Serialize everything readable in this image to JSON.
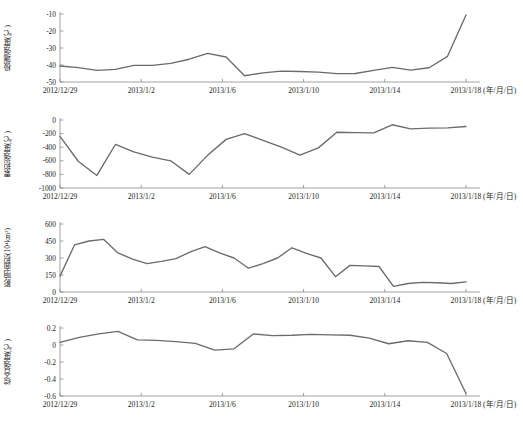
{
  "figure": {
    "partial_top_caption": "",
    "x_unit_label": "(年/月/日)",
    "x_tick_labels": [
      "2012/12/29",
      "2013/1/2",
      "2013/1/6",
      "2013/1/10",
      "2013/1/14",
      "2013/1/18"
    ],
    "line_color": "#6b6b6b",
    "axis_color": "#8c8c8c",
    "text_color": "#262626"
  },
  "chart_data": [
    {
      "type": "line",
      "title": "",
      "panel_index": 1,
      "ylabel": "极端强度(℃)",
      "xlabel": "(年/月/日)",
      "ylim": [
        -50,
        -10
      ],
      "ytick_labels": [
        "-10",
        "-20",
        "-30",
        "-40",
        "-50"
      ],
      "ytick_values": [
        -10,
        -20,
        -30,
        -40,
        -50
      ],
      "grid": false,
      "legend": "none",
      "x": [
        "2012/12/29",
        "2012/12/30",
        "2012/12/31",
        "2013/1/1",
        "2013/1/2",
        "2013/1/3",
        "2013/1/4",
        "2013/1/5",
        "2013/1/6",
        "2013/1/7",
        "2013/1/8",
        "2013/1/9",
        "2013/1/10",
        "2013/1/11",
        "2013/1/12",
        "2013/1/13",
        "2013/1/14",
        "2013/1/15",
        "2013/1/16",
        "2013/1/17",
        "2013/1/18",
        "2013/1/19"
      ],
      "values": [
        -40.6,
        -41.5,
        -43.2,
        -42.6,
        -40.2,
        -40.2,
        -39.0,
        -36.6,
        -33.2,
        -35.3,
        -46.3,
        -44.6,
        -43.6,
        -43.8,
        -44.2,
        -45.1,
        -45.0,
        -43.2,
        -41.4,
        -43.0,
        -41.6,
        -34.9,
        -10.6
      ],
      "values_note": "extreme intensity per day, deg C"
    },
    {
      "type": "line",
      "title": "",
      "panel_index": 2,
      "ylabel": "累积强度(℃)",
      "xlabel": "(年/月/日)",
      "ylim": [
        -1000,
        0
      ],
      "ytick_labels": [
        "0",
        "-200",
        "-400",
        "-600",
        "-800",
        "-1000"
      ],
      "ytick_values": [
        0,
        -200,
        -400,
        -600,
        -800,
        -1000
      ],
      "grid": false,
      "legend": "none",
      "x": [
        "2012/12/29",
        "2012/12/30",
        "2012/12/31",
        "2013/1/1",
        "2013/1/2",
        "2013/1/3",
        "2013/1/4",
        "2013/1/5",
        "2013/1/6",
        "2013/1/7",
        "2013/1/8",
        "2013/1/9",
        "2013/1/10",
        "2013/1/11",
        "2013/1/12",
        "2013/1/13",
        "2013/1/14",
        "2013/1/15",
        "2013/1/16",
        "2013/1/17",
        "2013/1/18"
      ],
      "values": [
        -240,
        -610,
        -815,
        -360,
        -470,
        -545,
        -600,
        -800,
        -520,
        -285,
        -200,
        -300,
        -400,
        -515,
        -410,
        -180,
        -185,
        -190,
        -70,
        -130,
        -120,
        -115,
        -95
      ],
      "values_note": "cumulative intensity per day, deg C"
    },
    {
      "type": "line",
      "title": "",
      "panel_index": 3,
      "ylabel": "影响面积(10⁴km²)",
      "xlabel": "(年/月/日)",
      "ylim": [
        0,
        600
      ],
      "ytick_labels": [
        "600",
        "450",
        "300",
        "150",
        "0"
      ],
      "ytick_values": [
        600,
        450,
        300,
        150,
        0
      ],
      "grid": false,
      "legend": "none",
      "x": [
        "2012/12/29",
        "2012/12/30",
        "2012/12/31",
        "2013/1/1",
        "2013/1/2",
        "2013/1/3",
        "2013/1/4",
        "2013/1/5",
        "2013/1/6",
        "2013/1/7",
        "2013/1/8",
        "2013/1/9",
        "2013/1/10",
        "2013/1/11",
        "2013/1/12",
        "2013/1/13",
        "2013/1/14",
        "2013/1/15",
        "2013/1/16",
        "2013/1/17",
        "2013/1/18"
      ],
      "values": [
        140,
        415,
        450,
        465,
        345,
        290,
        250,
        270,
        295,
        355,
        400,
        345,
        300,
        210,
        250,
        300,
        390,
        340,
        300,
        135,
        235,
        230,
        225,
        50,
        75,
        85,
        82,
        75,
        90
      ],
      "values_note": "affected area per day, 10^4 km^2"
    },
    {
      "type": "line",
      "title": "",
      "panel_index": 4,
      "ylabel": "综合强度(℃)",
      "xlabel": "(年/月/日)",
      "ylim": [
        -0.6,
        0.2
      ],
      "ytick_labels": [
        "0.2",
        "0",
        "-0.2",
        "-0.4",
        "-0.6"
      ],
      "ytick_values": [
        0.2,
        0,
        -0.2,
        -0.4,
        -0.6
      ],
      "grid": false,
      "legend": "none",
      "x": [
        "2012/12/29",
        "2012/12/30",
        "2012/12/31",
        "2013/1/1",
        "2013/1/2",
        "2013/1/3",
        "2013/1/4",
        "2013/1/5",
        "2013/1/6",
        "2013/1/7",
        "2013/1/8",
        "2013/1/9",
        "2013/1/10",
        "2013/1/11",
        "2013/1/12",
        "2013/1/13",
        "2013/1/14",
        "2013/1/15",
        "2013/1/16",
        "2013/1/17",
        "2013/1/18"
      ],
      "values": [
        0.03,
        0.09,
        0.13,
        0.16,
        0.06,
        0.055,
        0.04,
        0.02,
        -0.06,
        -0.045,
        0.13,
        0.11,
        0.115,
        0.125,
        0.12,
        0.115,
        0.08,
        0.015,
        0.05,
        0.03,
        -0.1,
        -0.57
      ],
      "values_note": "comprehensive intensity per day, deg C"
    }
  ]
}
